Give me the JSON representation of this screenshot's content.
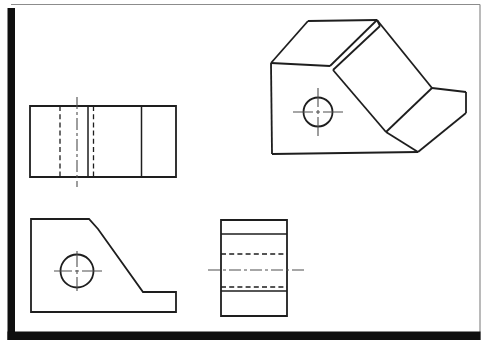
{
  "meta": {
    "width": 488,
    "height": 352,
    "label": "Engineering drawing: three orthographic views (top, front, right side) and an oblique pictorial view of a machined block with a slope, step and through hole"
  },
  "palette": {
    "paper": "#ffffff",
    "line": "#1e1e1e",
    "centerline": "#4f4f4f",
    "frame_thin": "#8c8c8c",
    "frame_thick": "#0f0f0f"
  },
  "styles": {
    "outline": {
      "width": 1.8
    },
    "solid": {
      "width": 1.5
    },
    "hidden": {
      "width": 1.3,
      "dash": "5 3.2"
    },
    "center": {
      "width": 1.1,
      "dash": "12 3 3 3",
      "color": "centerline"
    },
    "cross": {
      "width": 1.1,
      "color": "centerline"
    },
    "frame-thin": {
      "width": 1.2,
      "color": "frame_thin"
    },
    "frame-thick": {
      "fillColor": "frame_thick"
    }
  },
  "frame": {
    "id": "page-frame",
    "elements": [
      {
        "type": "line",
        "p": [
          11,
          4.5,
          480,
          4.5
        ],
        "style": "frame-thin",
        "name": "page-border-top"
      },
      {
        "type": "line",
        "p": [
          480,
          4.5,
          480,
          340
        ],
        "style": "frame-thin",
        "name": "page-border-right"
      },
      {
        "type": "rect",
        "p": [
          7.5,
          8,
          7.5,
          332
        ],
        "style": "frame-thick",
        "name": "page-border-left-bar"
      },
      {
        "type": "rect",
        "p": [
          7.5,
          331.5,
          473,
          8.5
        ],
        "style": "frame-thick",
        "name": "page-border-bottom-bar"
      }
    ]
  },
  "views": [
    {
      "id": "top-view",
      "elements": [
        {
          "type": "polygon",
          "points": [
            [
              30,
              106
            ],
            [
              176,
              106
            ],
            [
              176,
              177
            ],
            [
              30,
              177
            ]
          ],
          "style": "outline",
          "name": "top-view-outline"
        },
        {
          "type": "line",
          "p": [
            88,
            106,
            88,
            177
          ],
          "style": "solid",
          "name": "top-view-step-edge"
        },
        {
          "type": "line",
          "p": [
            141.5,
            106,
            141.5,
            177
          ],
          "style": "solid",
          "name": "top-view-slope-edge"
        },
        {
          "type": "line",
          "p": [
            60,
            106,
            60,
            177
          ],
          "style": "hidden",
          "name": "top-view-hole-hidden-left"
        },
        {
          "type": "line",
          "p": [
            93.5,
            106,
            93.5,
            177
          ],
          "style": "hidden",
          "name": "top-view-hole-hidden-right"
        },
        {
          "type": "line",
          "p": [
            77,
            97,
            77,
            187
          ],
          "style": "center",
          "name": "top-view-hole-centerline"
        }
      ]
    },
    {
      "id": "front-view",
      "elements": [
        {
          "type": "polygon",
          "points": [
            [
              31,
              219
            ],
            [
              89,
              219
            ],
            [
              98,
              229
            ],
            [
              143,
              292
            ],
            [
              176,
              292
            ],
            [
              176,
              312
            ],
            [
              31,
              312
            ]
          ],
          "style": "outline",
          "name": "front-view-outline"
        },
        {
          "type": "circle",
          "c": [
            77,
            271
          ],
          "r": 16.5,
          "style": "outline",
          "name": "front-view-hole"
        },
        {
          "type": "line",
          "p": [
            54,
            271,
            102,
            271
          ],
          "style": "cross",
          "dash": "18 3 4 3 20",
          "name": "front-view-hole-centerline-h"
        },
        {
          "type": "line",
          "p": [
            77,
            251,
            77,
            291
          ],
          "style": "cross",
          "dash": "16 3 4 3 16",
          "name": "front-view-hole-centerline-v"
        }
      ]
    },
    {
      "id": "side-view",
      "elements": [
        {
          "type": "polygon",
          "points": [
            [
              221,
              220
            ],
            [
              287,
              220
            ],
            [
              287,
              316
            ],
            [
              221,
              316
            ]
          ],
          "style": "outline",
          "name": "side-view-outline"
        },
        {
          "type": "line",
          "p": [
            221,
            234,
            287,
            234
          ],
          "style": "solid",
          "name": "side-view-step-edge"
        },
        {
          "type": "line",
          "p": [
            221,
            291,
            287,
            291
          ],
          "style": "solid",
          "name": "side-view-ledge-edge"
        },
        {
          "type": "line",
          "p": [
            221,
            254,
            287,
            254
          ],
          "style": "hidden",
          "name": "side-view-hole-hidden-top"
        },
        {
          "type": "line",
          "p": [
            221,
            287,
            287,
            287
          ],
          "style": "hidden",
          "name": "side-view-hole-hidden-bottom"
        },
        {
          "type": "line",
          "p": [
            208,
            270,
            306,
            270
          ],
          "style": "center",
          "name": "side-view-hole-centerline"
        }
      ]
    },
    {
      "id": "isometric-view",
      "elements": [
        {
          "type": "line",
          "p": [
            308,
            21,
            377,
            20
          ],
          "style": "outline",
          "name": "iso-top-back-edge"
        },
        {
          "type": "line",
          "p": [
            308,
            21,
            271,
            63
          ],
          "style": "outline",
          "name": "iso-top-left-edge"
        },
        {
          "type": "line",
          "p": [
            271,
            63,
            272,
            154
          ],
          "style": "outline",
          "name": "iso-front-left-edge"
        },
        {
          "type": "line",
          "p": [
            272,
            154,
            418,
            152
          ],
          "style": "outline",
          "name": "iso-bottom-front-edge"
        },
        {
          "type": "line",
          "p": [
            271,
            63,
            330,
            66
          ],
          "style": "outline",
          "name": "iso-top-front-edge"
        },
        {
          "type": "line",
          "p": [
            377,
            20,
            330,
            66
          ],
          "style": "outline",
          "name": "iso-shoulder-upper-edge"
        },
        {
          "type": "line",
          "p": [
            380,
            26,
            333,
            70
          ],
          "style": "outline",
          "name": "iso-shoulder-lower-edge"
        },
        {
          "type": "line",
          "p": [
            377,
            20,
            380,
            26
          ],
          "style": "outline",
          "name": "iso-shoulder-end-edge"
        },
        {
          "type": "line",
          "p": [
            377,
            20,
            432,
            88
          ],
          "style": "outline",
          "name": "iso-slope-right-edge"
        },
        {
          "type": "line",
          "p": [
            333,
            70,
            386,
            132
          ],
          "style": "outline",
          "name": "iso-slope-left-edge"
        },
        {
          "type": "line",
          "p": [
            432,
            88,
            386,
            132
          ],
          "style": "outline",
          "name": "iso-slope-bottom-edge"
        },
        {
          "type": "line",
          "p": [
            432,
            88,
            466,
            92
          ],
          "style": "outline",
          "name": "iso-step-top-edge"
        },
        {
          "type": "line",
          "p": [
            466,
            92,
            466,
            113
          ],
          "style": "outline",
          "name": "iso-step-right-edge"
        },
        {
          "type": "line",
          "p": [
            466,
            113,
            418,
            152
          ],
          "style": "outline",
          "name": "iso-step-bottom-edge"
        },
        {
          "type": "line",
          "p": [
            386,
            132,
            418,
            152
          ],
          "style": "outline",
          "name": "iso-step-front-edge"
        },
        {
          "type": "circle",
          "c": [
            318,
            112
          ],
          "r": 14.5,
          "style": "outline",
          "name": "iso-hole"
        },
        {
          "type": "line",
          "p": [
            293,
            112,
            343,
            112
          ],
          "style": "cross",
          "dash": "20 3 4 3 20",
          "name": "iso-hole-centerline-h"
        },
        {
          "type": "line",
          "p": [
            318,
            88,
            318,
            137
          ],
          "style": "cross",
          "dash": "19 3 4 3 19",
          "name": "iso-hole-centerline-v"
        }
      ]
    }
  ]
}
